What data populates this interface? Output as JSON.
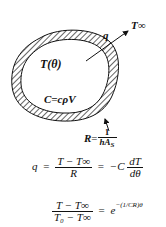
{
  "diagram": {
    "body_label": "T(θ)",
    "capacitance_label": "C=cρV",
    "heat_flow_label": "q",
    "ambient_label": "T∞",
    "resistance": {
      "lhs": "R",
      "eq": "=",
      "num": "1",
      "den_h": "h̄",
      "den_A": "A",
      "den_sub": "S"
    },
    "colors": {
      "ink": "#111111",
      "background": "#ffffff"
    }
  },
  "equations": {
    "eq1": {
      "lhs": "q",
      "eq1": "=",
      "num": "T − T∞",
      "den": "R",
      "eq2": "=",
      "rhs_coef": "−C",
      "deriv_num": "dT",
      "deriv_den": "dθ"
    },
    "eq2": {
      "num": "T − T∞",
      "den": "T₀ − T∞",
      "eq": "=",
      "base": "e",
      "exponent": "−(1/CR)θ"
    }
  }
}
